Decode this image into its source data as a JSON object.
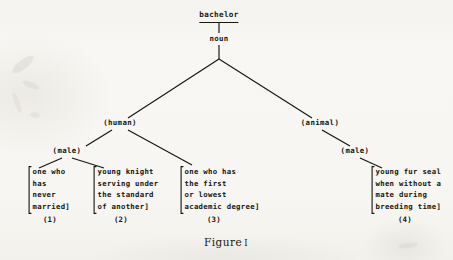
{
  "figure": {
    "caption_word": "Figure",
    "caption_number": "I",
    "ink_color": "#16150f",
    "paper_color": "#f7f6f2"
  },
  "tree": {
    "root": {
      "headword": "bachelor",
      "pos": "noun"
    },
    "branch_nodes": [
      {
        "id": "human",
        "label": "(human)"
      },
      {
        "id": "animal",
        "label": "(animal)"
      },
      {
        "id": "male-human",
        "label": "(male)"
      },
      {
        "id": "male-animal",
        "label": "(male)"
      }
    ],
    "leaves": [
      {
        "number": "(1)",
        "open_bracket": "[",
        "close_bracket": "]",
        "lines": [
          "one who",
          "has",
          "never",
          "married"
        ]
      },
      {
        "number": "(2)",
        "open_bracket": "[",
        "close_bracket": "]",
        "lines": [
          "young knight",
          "serving under",
          "the standard",
          "of another"
        ]
      },
      {
        "number": "(3)",
        "open_bracket": "[",
        "close_bracket": "]",
        "lines": [
          "one who has",
          "the first",
          "or lowest",
          "academic degree"
        ]
      },
      {
        "number": "(4)",
        "open_bracket": "[",
        "close_bracket": "]",
        "lines": [
          "young fur seal",
          "when without a",
          "mate during",
          "breeding time"
        ]
      }
    ]
  }
}
